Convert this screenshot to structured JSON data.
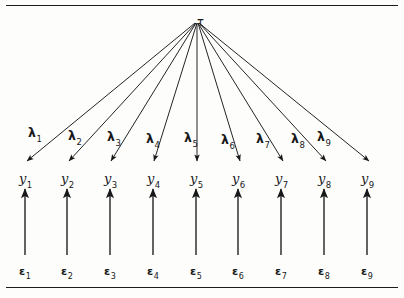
{
  "figure": {
    "type": "path-diagram",
    "background_color": "#fdfdfb",
    "ink_color": "#17181a"
  },
  "latent": {
    "symbol": "τ",
    "name": "tau",
    "x": 197,
    "y": 13
  },
  "loadings": [
    {
      "symbol": "λ",
      "sub": "1",
      "x": 28,
      "y": 124
    },
    {
      "symbol": "λ",
      "sub": "2",
      "x": 68,
      "y": 127
    },
    {
      "symbol": "λ",
      "sub": "3",
      "x": 107,
      "y": 128
    },
    {
      "symbol": "λ",
      "sub": "4",
      "x": 146,
      "y": 130
    },
    {
      "symbol": "λ",
      "sub": "5",
      "x": 184,
      "y": 129
    },
    {
      "symbol": "λ",
      "sub": "6",
      "x": 221,
      "y": 131
    },
    {
      "symbol": "λ",
      "sub": "7",
      "x": 256,
      "y": 130
    },
    {
      "symbol": "λ",
      "sub": "8",
      "x": 291,
      "y": 130
    },
    {
      "symbol": "λ",
      "sub": "9",
      "x": 317,
      "y": 128
    }
  ],
  "indicators": [
    {
      "symbol": "y",
      "sub": "1",
      "x": 19,
      "y": 170
    },
    {
      "symbol": "y",
      "sub": "2",
      "x": 61,
      "y": 170
    },
    {
      "symbol": "y",
      "sub": "3",
      "x": 104,
      "y": 170
    },
    {
      "symbol": "y",
      "sub": "4",
      "x": 147,
      "y": 170
    },
    {
      "symbol": "y",
      "sub": "5",
      "x": 190,
      "y": 170
    },
    {
      "symbol": "y",
      "sub": "6",
      "x": 232,
      "y": 170
    },
    {
      "symbol": "y",
      "sub": "7",
      "x": 275,
      "y": 170
    },
    {
      "symbol": "y",
      "sub": "8",
      "x": 318,
      "y": 170
    },
    {
      "symbol": "y",
      "sub": "9",
      "x": 361,
      "y": 170
    }
  ],
  "errors": [
    {
      "symbol": "ε",
      "sub": "1",
      "x": 19,
      "y": 262
    },
    {
      "symbol": "ε",
      "sub": "2",
      "x": 61,
      "y": 262
    },
    {
      "symbol": "ε",
      "sub": "3",
      "x": 104,
      "y": 262
    },
    {
      "symbol": "ε",
      "sub": "4",
      "x": 147,
      "y": 262
    },
    {
      "symbol": "ε",
      "sub": "5",
      "x": 190,
      "y": 262
    },
    {
      "symbol": "ε",
      "sub": "6",
      "x": 232,
      "y": 262
    },
    {
      "symbol": "ε",
      "sub": "7",
      "x": 275,
      "y": 262
    },
    {
      "symbol": "ε",
      "sub": "8",
      "x": 318,
      "y": 262
    },
    {
      "symbol": "ε",
      "sub": "9",
      "x": 361,
      "y": 262
    }
  ],
  "loading_arrows": [
    {
      "x1": 195,
      "y1": 23,
      "x2": 27,
      "y2": 161
    },
    {
      "x1": 196,
      "y1": 23,
      "x2": 69,
      "y2": 161
    },
    {
      "x1": 196,
      "y1": 23,
      "x2": 111,
      "y2": 161
    },
    {
      "x1": 197,
      "y1": 23,
      "x2": 154,
      "y2": 161
    },
    {
      "x1": 197,
      "y1": 23,
      "x2": 197,
      "y2": 161
    },
    {
      "x1": 198,
      "y1": 23,
      "x2": 240,
      "y2": 161
    },
    {
      "x1": 198,
      "y1": 23,
      "x2": 283,
      "y2": 161
    },
    {
      "x1": 199,
      "y1": 23,
      "x2": 326,
      "y2": 161
    },
    {
      "x1": 199,
      "y1": 23,
      "x2": 369,
      "y2": 161
    }
  ],
  "error_arrows": [
    {
      "x1": 25,
      "y1": 255,
      "x2": 25,
      "y2": 189
    },
    {
      "x1": 67,
      "y1": 255,
      "x2": 67,
      "y2": 189
    },
    {
      "x1": 110,
      "y1": 255,
      "x2": 110,
      "y2": 189
    },
    {
      "x1": 153,
      "y1": 255,
      "x2": 153,
      "y2": 189
    },
    {
      "x1": 196,
      "y1": 255,
      "x2": 196,
      "y2": 189
    },
    {
      "x1": 238,
      "y1": 255,
      "x2": 238,
      "y2": 189
    },
    {
      "x1": 281,
      "y1": 255,
      "x2": 281,
      "y2": 189
    },
    {
      "x1": 324,
      "y1": 255,
      "x2": 324,
      "y2": 189
    },
    {
      "x1": 367,
      "y1": 255,
      "x2": 367,
      "y2": 189
    }
  ],
  "rules": {
    "top_label": "top-border-rule",
    "bottom_label": "bottom-border-rule"
  }
}
